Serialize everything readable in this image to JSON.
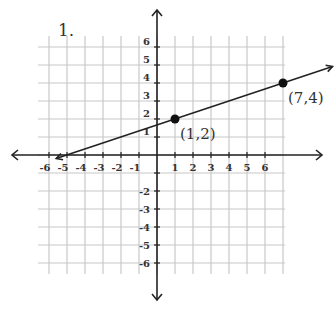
{
  "problem": {
    "number_label": "1."
  },
  "chart_data": {
    "type": "line",
    "title": "",
    "xlabel": "",
    "ylabel": "",
    "grid": true,
    "xlim": [
      -6.5,
      7
    ],
    "ylim": [
      -6.5,
      6.5
    ],
    "x_ticks": [
      "-6",
      "-5",
      "-4",
      "-3",
      "-2",
      "-1",
      "1",
      "2",
      "3",
      "4",
      "5",
      "6"
    ],
    "y_ticks": [
      "6",
      "5",
      "4",
      "3",
      "2",
      "1",
      "-2",
      "-3",
      "-4",
      "-5",
      "-6"
    ],
    "series": [
      {
        "name": "line through (1,2) and (7,4)",
        "slope": 0.3333,
        "intercept": 1.6667,
        "points": [
          {
            "x": 1,
            "y": 2,
            "label": "(1,2)"
          },
          {
            "x": 7,
            "y": 4,
            "label": "(7,4)"
          }
        ]
      }
    ],
    "colors": {
      "axis": "#222222",
      "grid": "#c8c8c8",
      "line": "#222222",
      "text": "#333333"
    }
  }
}
